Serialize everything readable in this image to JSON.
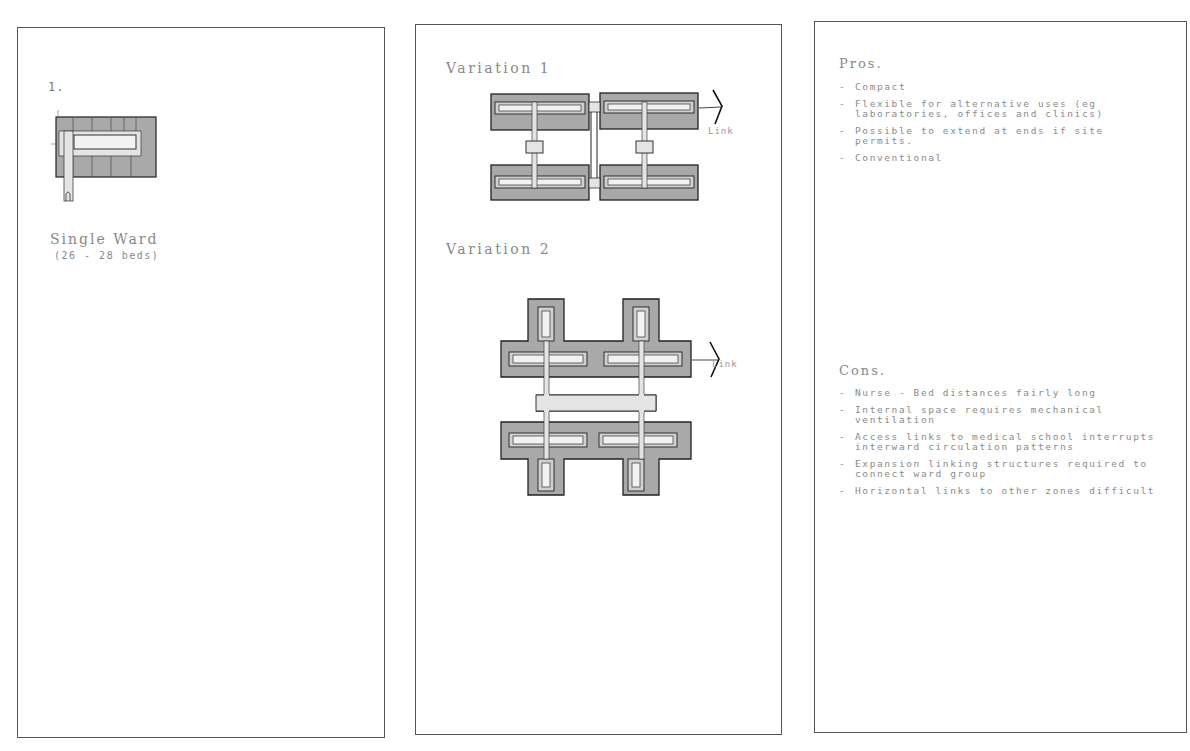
{
  "panels": {
    "single_ward": {
      "number": "1.",
      "title": "Single Ward",
      "subtitle": "(26 - 28 beds)"
    },
    "variations": {
      "variation_1": {
        "title": "Variation 1",
        "link_label": "Link"
      },
      "variation_2": {
        "title": "Variation 2",
        "link_label": "Link"
      }
    },
    "evaluation": {
      "pros": {
        "title": "Pros.",
        "items": [
          "Compact",
          "Flexible for alternative uses (eg laboratories, offices and clinics)",
          "Possible to extend at ends if site permits.",
          "Conventional"
        ]
      },
      "cons": {
        "title": "Cons.",
        "items": [
          "Nurse - Bed distances fairly long",
          "Internal space requires mechanical ventilation",
          "Access links to medical school interrupts interward circulation patterns",
          "Expansion linking structures required to connect ward group",
          "Horizontal links to other zones difficult"
        ]
      }
    }
  },
  "colors": {
    "ward_fill": "#a9a9a9",
    "core_fill": "#f2f2f2",
    "corridor_fill": "#e4e4e4",
    "line": "#222222",
    "frame": "#555555",
    "text": "#888888"
  }
}
